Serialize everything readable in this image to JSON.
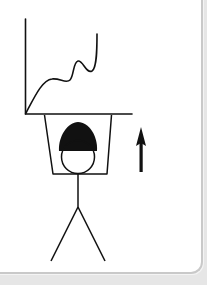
{
  "diagram": {
    "elements": {
      "chart": {
        "type": "line",
        "trend": "rising with fluctuations"
      },
      "figure": {
        "headgear": "hard-hat"
      },
      "arrow": {
        "direction": "up"
      }
    },
    "colors": {
      "ink": "#111111",
      "card": "#ffffff",
      "background": "#e6e6e6",
      "border": "#c9c9c9"
    }
  }
}
